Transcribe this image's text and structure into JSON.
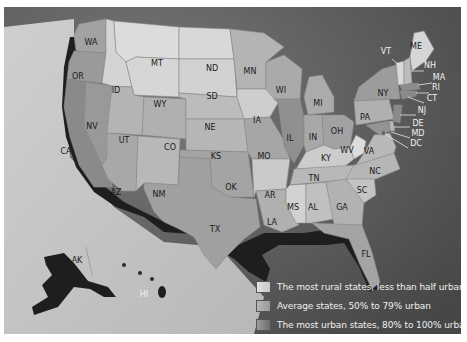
{
  "map": {
    "colors": {
      "ocean": "#5a5a5a",
      "land_background": "#c8c8c8",
      "rural": "#d9d9d9",
      "average": "#a9a9a9",
      "urban": "#7e7e7e",
      "coast_shadow": "#1e1e1e"
    },
    "states": [
      {
        "abbr": "WA",
        "category": "average"
      },
      {
        "abbr": "OR",
        "category": "average"
      },
      {
        "abbr": "CA",
        "category": "urban"
      },
      {
        "abbr": "NV",
        "category": "urban"
      },
      {
        "abbr": "ID",
        "category": "rural"
      },
      {
        "abbr": "MT",
        "category": "rural"
      },
      {
        "abbr": "WY",
        "category": "rural"
      },
      {
        "abbr": "UT",
        "category": "average"
      },
      {
        "abbr": "CO",
        "category": "average"
      },
      {
        "abbr": "AZ",
        "category": "urban"
      },
      {
        "abbr": "NM",
        "category": "average"
      },
      {
        "abbr": "ND",
        "category": "rural"
      },
      {
        "abbr": "SD",
        "category": "rural"
      },
      {
        "abbr": "NE",
        "category": "average"
      },
      {
        "abbr": "KS",
        "category": "average"
      },
      {
        "abbr": "OK",
        "category": "average"
      },
      {
        "abbr": "TX",
        "category": "average"
      },
      {
        "abbr": "MN",
        "category": "average"
      },
      {
        "abbr": "IA",
        "category": "rural"
      },
      {
        "abbr": "MO",
        "category": "average"
      },
      {
        "abbr": "AR",
        "category": "rural"
      },
      {
        "abbr": "LA",
        "category": "average"
      },
      {
        "abbr": "WI",
        "category": "average"
      },
      {
        "abbr": "IL",
        "category": "urban"
      },
      {
        "abbr": "MI",
        "category": "average"
      },
      {
        "abbr": "IN",
        "category": "average"
      },
      {
        "abbr": "OH",
        "category": "average"
      },
      {
        "abbr": "KY",
        "category": "rural"
      },
      {
        "abbr": "TN",
        "category": "average"
      },
      {
        "abbr": "MS",
        "category": "rural"
      },
      {
        "abbr": "AL",
        "category": "average"
      },
      {
        "abbr": "GA",
        "category": "average"
      },
      {
        "abbr": "FL",
        "category": "urban"
      },
      {
        "abbr": "SC",
        "category": "average"
      },
      {
        "abbr": "NC",
        "category": "average"
      },
      {
        "abbr": "VA",
        "category": "average"
      },
      {
        "abbr": "WV",
        "category": "rural"
      },
      {
        "abbr": "PA",
        "category": "average"
      },
      {
        "abbr": "NY",
        "category": "urban"
      },
      {
        "abbr": "VT",
        "category": "rural"
      },
      {
        "abbr": "ME",
        "category": "rural"
      },
      {
        "abbr": "NH",
        "category": "average"
      },
      {
        "abbr": "MA",
        "category": "urban"
      },
      {
        "abbr": "RI",
        "category": "urban"
      },
      {
        "abbr": "CT",
        "category": "urban"
      },
      {
        "abbr": "NJ",
        "category": "urban"
      },
      {
        "abbr": "DE",
        "category": "average"
      },
      {
        "abbr": "MD",
        "category": "urban"
      },
      {
        "abbr": "DC",
        "category": "urban"
      },
      {
        "abbr": "AK",
        "category": "average"
      },
      {
        "abbr": "HI",
        "category": "urban"
      }
    ]
  },
  "legend": {
    "items": [
      {
        "category": "rural",
        "label": "The most rural states, less than half urban"
      },
      {
        "category": "average",
        "label": "Average states, 50% to 79% urban"
      },
      {
        "category": "urban",
        "label": "The most urban states, 80% to 100% urban"
      }
    ]
  }
}
